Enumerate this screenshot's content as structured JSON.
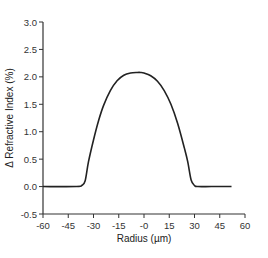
{
  "chart_data": {
    "type": "line",
    "title": "",
    "xlabel": "Radius (µm)",
    "ylabel": "Δ Refractive Index (%)",
    "xlim": [
      -60,
      60
    ],
    "ylim": [
      -0.5,
      3.0
    ],
    "xticks": [
      -60,
      -45,
      -30,
      -15,
      0,
      15,
      30,
      45,
      60
    ],
    "xtick_labels": [
      "-60",
      "-45",
      "-30",
      "-15",
      "-0",
      "15",
      "30",
      "45",
      "60"
    ],
    "yticks": [
      -0.5,
      0.0,
      0.5,
      1.0,
      1.5,
      2.0,
      2.5,
      3.0
    ],
    "ytick_labels": [
      "-0.5",
      "0.0",
      "0.5",
      "1.0",
      "1.5",
      "2.0",
      "2.5",
      "3.0"
    ],
    "grid": false,
    "legend": null,
    "series": [
      {
        "name": "Refractive index profile",
        "color": "#222222",
        "x": [
          -60,
          -40,
          -37,
          -35,
          -33,
          -30,
          -27,
          -24,
          -20,
          -16,
          -12,
          -8,
          -4,
          -2,
          0,
          4,
          8,
          12,
          16,
          20,
          24,
          26,
          28,
          30,
          32,
          40,
          52
        ],
        "y": [
          0.0,
          0.0,
          0.02,
          0.1,
          0.45,
          0.85,
          1.2,
          1.48,
          1.75,
          1.93,
          2.03,
          2.07,
          2.08,
          2.08,
          2.07,
          2.02,
          1.92,
          1.75,
          1.5,
          1.15,
          0.7,
          0.45,
          0.12,
          0.02,
          0.0,
          0.0,
          0.0
        ]
      }
    ]
  },
  "axes": {
    "x_title": "Radius (µm)",
    "y_title": "Δ Refractive Index (%)"
  }
}
